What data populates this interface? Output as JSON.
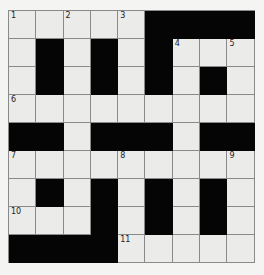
{
  "puzzle": {
    "rows": 9,
    "cols": 9,
    "layout": [
      "WWWWWBBBB",
      "WBWBWBWWW",
      "WBWBWBWBW",
      "WWWWWWWWW",
      "BBWBBBWBB",
      "WWWWWWWWW",
      "WBWBWBWBW",
      "WWWBWBWBW",
      "BBBBWWWWW"
    ],
    "numbers": [
      {
        "row": 0,
        "col": 0,
        "n": "1"
      },
      {
        "row": 0,
        "col": 2,
        "n": "2"
      },
      {
        "row": 0,
        "col": 4,
        "n": "3"
      },
      {
        "row": 1,
        "col": 6,
        "n": "4"
      },
      {
        "row": 1,
        "col": 8,
        "n": "5"
      },
      {
        "row": 3,
        "col": 0,
        "n": "6"
      },
      {
        "row": 5,
        "col": 0,
        "n": "7"
      },
      {
        "row": 5,
        "col": 4,
        "n": "8"
      },
      {
        "row": 5,
        "col": 8,
        "n": "9"
      },
      {
        "row": 7,
        "col": 0,
        "n": "10"
      },
      {
        "row": 8,
        "col": 4,
        "n": "11"
      }
    ]
  },
  "colors": {
    "black_cell": "#050505",
    "white_cell": "#ebebe9",
    "grid_line": "#8a8a8a"
  }
}
